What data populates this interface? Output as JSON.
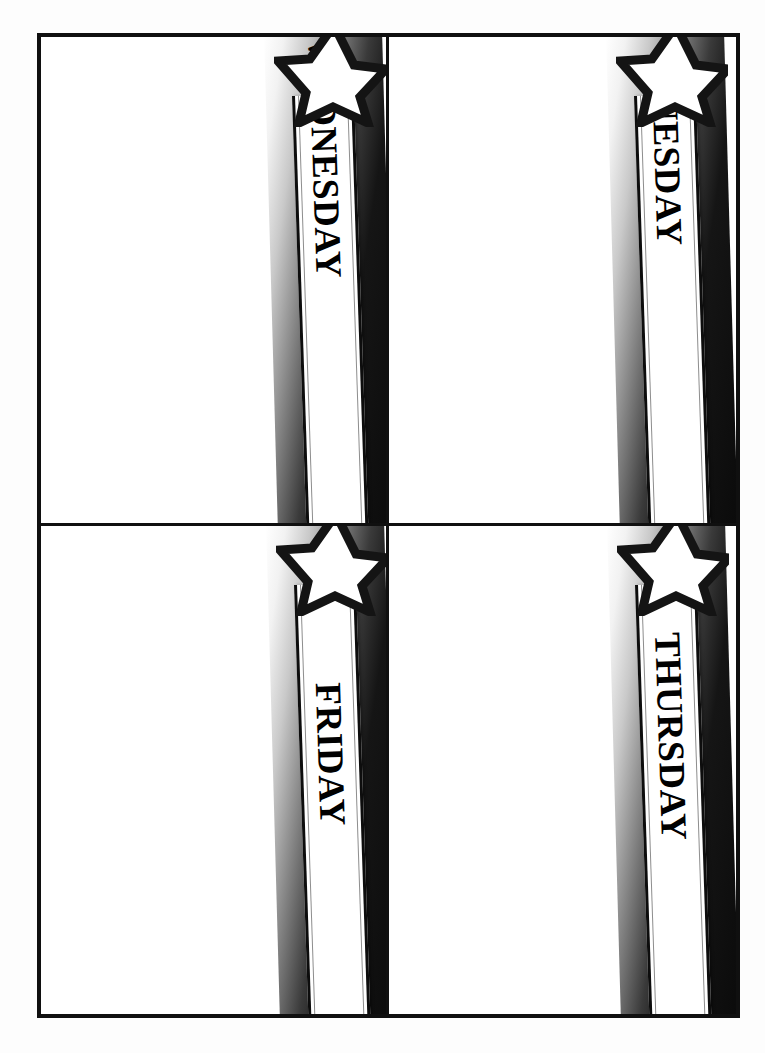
{
  "document": {
    "type": "weekday-planner-template",
    "title": "Weekday Banner Cards",
    "page_background": "#fdfdfd",
    "frame_color": "#101010",
    "accent_dark": "#0b0b0b",
    "banner_fill": "#ffffff"
  },
  "layout": {
    "columns": 2,
    "rows": 2
  },
  "cells": [
    {
      "id": "cell-wednesday",
      "day_label": "WEDNESDAY",
      "star_icon": "five-point-star-icon",
      "banner_name": "wednesday-banner",
      "note_area_label": ""
    },
    {
      "id": "cell-tuesday",
      "day_label": "TUESDAY",
      "star_icon": "five-point-star-icon",
      "banner_name": "tuesday-banner",
      "note_area_label": ""
    },
    {
      "id": "cell-friday",
      "day_label": "FRIDAY",
      "star_icon": "five-point-star-icon",
      "banner_name": "friday-banner",
      "note_area_label": ""
    },
    {
      "id": "cell-thursday",
      "day_label": "THURSDAY",
      "star_icon": "five-point-star-icon",
      "banner_name": "thursday-banner",
      "note_area_label": ""
    }
  ]
}
